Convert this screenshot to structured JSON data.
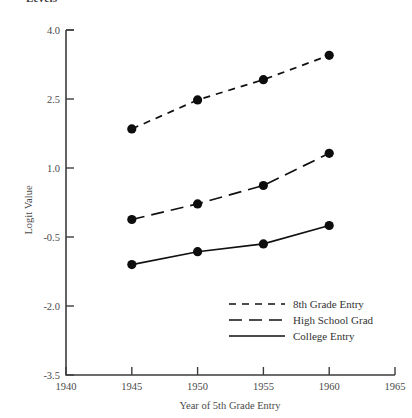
{
  "clipped_title": "Levels",
  "chart_data": {
    "type": "line",
    "title": "Levels",
    "xlabel": "Year of 5th Grade Entry",
    "ylabel": "Logit Value",
    "x": [
      1945,
      1950,
      1955,
      1960
    ],
    "xlim": [
      1940,
      1965
    ],
    "ylim": [
      -3.5,
      4.0
    ],
    "xticks": [
      "1940",
      "1945",
      "1950",
      "1955",
      "1960",
      "1965"
    ],
    "xtick_values": [
      1940,
      1945,
      1950,
      1955,
      1960,
      1965
    ],
    "yticks": [
      "4.0",
      "2.5",
      "1.0",
      "-0.5",
      "-2.0",
      "-3.5"
    ],
    "ytick_values": [
      4.0,
      2.5,
      1.0,
      -0.5,
      -2.0,
      -3.5
    ],
    "grid": false,
    "legend_position": "bottom-right",
    "markers": "filled-circle",
    "series": [
      {
        "name": "8th Grade Entry",
        "style": "dash-short",
        "values": [
          1.85,
          2.48,
          2.92,
          3.45
        ]
      },
      {
        "name": "High School Grad",
        "style": "dash-long",
        "values": [
          -0.12,
          0.22,
          0.62,
          1.32
        ]
      },
      {
        "name": "College Entry",
        "style": "solid",
        "values": [
          -1.1,
          -0.82,
          -0.65,
          -0.25
        ]
      }
    ]
  },
  "colors": {
    "ink": "#111111",
    "axis": "#3d3d3d",
    "text": "#4a4a4a",
    "background": "#ffffff"
  }
}
